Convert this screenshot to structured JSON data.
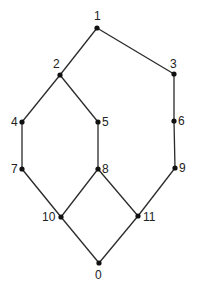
{
  "diagram": {
    "type": "lattice",
    "nodes": [
      {
        "id": "1",
        "x": 97,
        "y": 28,
        "label": "1",
        "lx": 94,
        "ly": 20,
        "anchor": "start"
      },
      {
        "id": "2",
        "x": 60,
        "y": 75,
        "label": "2",
        "lx": 53,
        "ly": 68,
        "anchor": "start"
      },
      {
        "id": "3",
        "x": 174,
        "y": 74,
        "label": "3",
        "lx": 170,
        "ly": 68,
        "anchor": "start"
      },
      {
        "id": "4",
        "x": 22,
        "y": 122,
        "label": "4",
        "lx": 11,
        "ly": 126,
        "anchor": "start"
      },
      {
        "id": "5",
        "x": 98,
        "y": 122,
        "label": "5",
        "lx": 102,
        "ly": 126,
        "anchor": "start"
      },
      {
        "id": "6",
        "x": 174,
        "y": 121,
        "label": "6",
        "lx": 178,
        "ly": 125,
        "anchor": "start"
      },
      {
        "id": "7",
        "x": 22,
        "y": 169,
        "label": "7",
        "lx": 11,
        "ly": 173,
        "anchor": "start"
      },
      {
        "id": "8",
        "x": 98,
        "y": 169,
        "label": "8",
        "lx": 102,
        "ly": 173,
        "anchor": "start"
      },
      {
        "id": "9",
        "x": 175,
        "y": 168,
        "label": "9",
        "lx": 179,
        "ly": 172,
        "anchor": "start"
      },
      {
        "id": "10",
        "x": 61,
        "y": 217,
        "label": "10",
        "lx": 42,
        "ly": 221,
        "anchor": "start"
      },
      {
        "id": "11",
        "x": 138,
        "y": 216,
        "label": "11",
        "lx": 143,
        "ly": 221,
        "anchor": "start"
      },
      {
        "id": "0",
        "x": 99,
        "y": 263,
        "label": "0",
        "lx": 95,
        "ly": 279,
        "anchor": "start"
      }
    ],
    "edges": [
      [
        "1",
        "2"
      ],
      [
        "1",
        "3"
      ],
      [
        "2",
        "4"
      ],
      [
        "2",
        "5"
      ],
      [
        "3",
        "6"
      ],
      [
        "4",
        "7"
      ],
      [
        "5",
        "8"
      ],
      [
        "6",
        "9"
      ],
      [
        "7",
        "10"
      ],
      [
        "8",
        "10"
      ],
      [
        "8",
        "11"
      ],
      [
        "9",
        "11"
      ],
      [
        "10",
        "0"
      ],
      [
        "11",
        "0"
      ]
    ]
  }
}
